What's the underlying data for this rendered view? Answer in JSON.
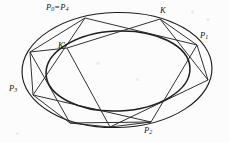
{
  "figure": {
    "kind": "geometry-diagram",
    "background_color": "#fcfcfc",
    "ink_color": "#1d1d1d",
    "width": 229,
    "height": 143
  },
  "labels": {
    "p0p4": {
      "base": "P",
      "sub": "0",
      "eq": "=",
      "base2": "P",
      "sub2": "4",
      "text": "P0 = P4"
    },
    "k": {
      "text": "K"
    },
    "kprime": {
      "base": "K",
      "prime": "'",
      "text": "K'"
    },
    "p1": {
      "base": "P",
      "sub": "1",
      "text": "P1"
    },
    "p2": {
      "base": "P",
      "sub": "2",
      "text": "P2"
    },
    "p3": {
      "base": "P",
      "sub": "3",
      "text": "P3"
    }
  },
  "geometry": {
    "outer_ellipse": {
      "cx": 117,
      "cy": 70,
      "rx": 95,
      "ry": 57.5,
      "rotation": -1.5
    },
    "inner_ellipse": {
      "cx": 118,
      "cy": 71,
      "rx": 72,
      "ry": 40,
      "rotation": -2.5
    },
    "vertices": {
      "P0": {
        "x": 85,
        "y": 18
      },
      "P1": {
        "x": 197,
        "y": 45
      },
      "P2": {
        "x": 151,
        "y": 122
      },
      "P3": {
        "x": 33,
        "y": 95
      },
      "K": {
        "x": 160,
        "y": 19
      },
      "Kprime": {
        "x": 67,
        "y": 48
      },
      "K2": {
        "x": 208,
        "y": 80
      },
      "K3": {
        "x": 110,
        "y": 127
      },
      "V1": {
        "x": 30,
        "y": 52
      },
      "V2": {
        "x": 70,
        "y": 123
      }
    },
    "chords": [
      {
        "name": "P0-P1",
        "from": "P0",
        "to": "P1"
      },
      {
        "name": "P1-P2",
        "from": "P1",
        "to": "P2"
      },
      {
        "name": "P2-P3",
        "from": "P2",
        "to": "P3"
      },
      {
        "name": "P3-P0",
        "from": "P3",
        "to": "P0"
      },
      {
        "name": "K-K2",
        "from": "K",
        "to": "K2"
      },
      {
        "name": "K2-K3",
        "from": "K2",
        "to": "K3"
      },
      {
        "name": "K3-Kprime",
        "from": "K3",
        "to": "Kprime"
      },
      {
        "name": "Kprime-K",
        "from": "Kprime",
        "to": "K"
      },
      {
        "name": "V1-P0",
        "from": "V1",
        "to": "P0"
      },
      {
        "name": "V1-V2",
        "from": "V1",
        "to": "V2"
      },
      {
        "name": "V2-P2",
        "from": "V2",
        "to": "P2"
      }
    ]
  }
}
